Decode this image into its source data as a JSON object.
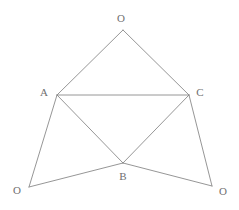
{
  "figure": {
    "background_color": "#ffffff",
    "line_color": "#8a8a8a",
    "label_color": "#6f6f6f",
    "canvas": {
      "width": 239,
      "height": 210
    },
    "vertices": [
      {
        "id": "O_top",
        "label": "O",
        "x": 123,
        "y": 30,
        "label_x": 121,
        "label_y": 18
      },
      {
        "id": "A",
        "label": "A",
        "x": 57,
        "y": 95,
        "label_x": 44,
        "label_y": 92
      },
      {
        "id": "C",
        "label": "C",
        "x": 189,
        "y": 95,
        "label_x": 200,
        "label_y": 92
      },
      {
        "id": "B",
        "label": "B",
        "x": 123,
        "y": 163,
        "label_x": 123,
        "label_y": 176
      },
      {
        "id": "O_bottom_left",
        "label": "O",
        "x": 29,
        "y": 187,
        "label_x": 17,
        "label_y": 190
      },
      {
        "id": "O_bottom_right",
        "label": "O",
        "x": 212,
        "y": 186,
        "label_x": 223,
        "label_y": 191
      }
    ],
    "edges": [
      {
        "id": "edge-Otop-A",
        "from": "O_top",
        "to": "A"
      },
      {
        "id": "edge-Otop-C",
        "from": "O_top",
        "to": "C"
      },
      {
        "id": "edge-A-C",
        "from": "A",
        "to": "C"
      },
      {
        "id": "edge-A-B",
        "from": "A",
        "to": "B"
      },
      {
        "id": "edge-C-B",
        "from": "C",
        "to": "B"
      },
      {
        "id": "edge-A-Obl",
        "from": "A",
        "to": "O_bottom_left"
      },
      {
        "id": "edge-Obl-B",
        "from": "O_bottom_left",
        "to": "B"
      },
      {
        "id": "edge-B-Obr",
        "from": "B",
        "to": "O_bottom_right"
      },
      {
        "id": "edge-C-Obr",
        "from": "C",
        "to": "O_bottom_right"
      }
    ]
  }
}
